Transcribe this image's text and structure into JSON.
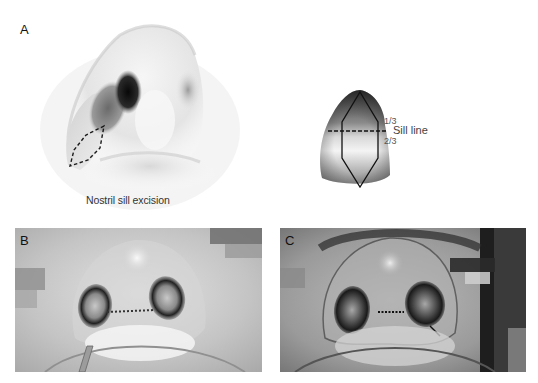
{
  "figure": {
    "panels": [
      {
        "id": "A",
        "label": "A",
        "type": "illustration",
        "description": "Inferior oblique view of nose with dashed diamond excision outline on nostril sill",
        "caption": "Nostril sill excision"
      },
      {
        "id": "A-detail",
        "type": "illustration",
        "description": "Nostril sill schematic with diamond excision",
        "annotations": {
          "upper_fraction": "1/3",
          "sill_line": "Sill line",
          "lower_fraction": "2/3"
        }
      },
      {
        "id": "B",
        "label": "B",
        "type": "clinical-photo",
        "description": "Basal view immediately after nostril sill excision with sutures"
      },
      {
        "id": "C",
        "label": "C",
        "type": "clinical-photo",
        "description": "Basal view after nostril sill excision with sutures"
      }
    ],
    "colors": {
      "background": "#ffffff",
      "ink": "#111111",
      "dash_line": "#1a1a1a"
    }
  }
}
